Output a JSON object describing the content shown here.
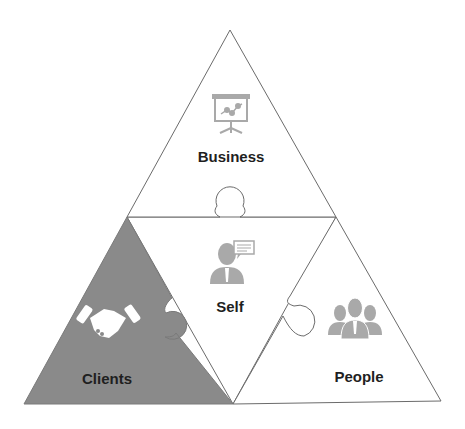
{
  "diagram": {
    "type": "puzzle-triangle",
    "colors": {
      "outline": "#6b6b6b",
      "clients_fill": "#8a8a8a",
      "piece_fill": "#ffffff",
      "icon_gray": "#a9a9a9",
      "icon_white": "#ffffff",
      "label": "#1f1f1f"
    },
    "pieces": [
      {
        "id": "business",
        "label": "Business",
        "icon": "presentation-board-icon"
      },
      {
        "id": "self",
        "label": "Self",
        "icon": "person-speech-bubble-icon"
      },
      {
        "id": "clients",
        "label": "Clients",
        "icon": "handshake-icon"
      },
      {
        "id": "people",
        "label": "People",
        "icon": "group-people-icon"
      }
    ]
  }
}
